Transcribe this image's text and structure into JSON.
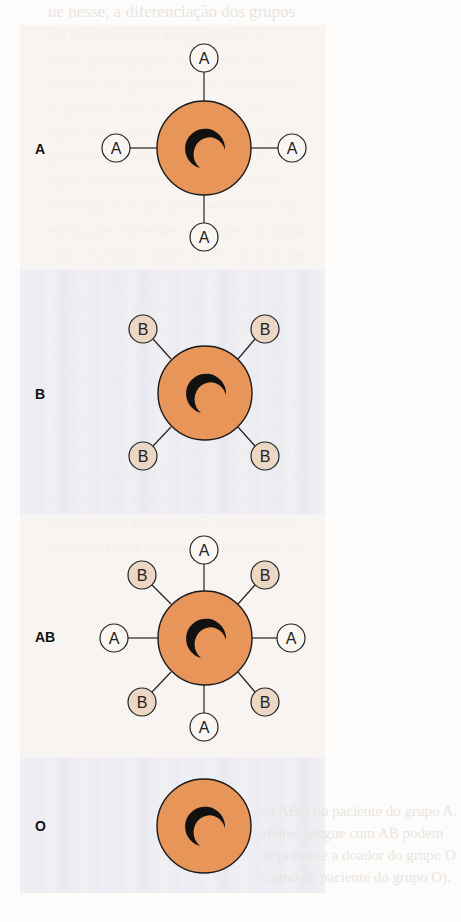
{
  "figure": {
    "colors": {
      "cell_fill": "#e8955a",
      "cell_stroke": "#1a1a1a",
      "antigen_a_fill": "#faf6f1",
      "antigen_b_fill": "#ecd7c4",
      "panel_warm": "#f6f2ee",
      "panel_cool": "#eceef3"
    },
    "panels": [
      {
        "label": "A",
        "antigens": [
          "A",
          "A",
          "A",
          "A"
        ]
      },
      {
        "label": "B",
        "antigens": [
          "B",
          "B",
          "B",
          "B"
        ]
      },
      {
        "label": "AB",
        "antigens": [
          "A",
          "B",
          "A",
          "B",
          "A",
          "B",
          "A",
          "B"
        ]
      },
      {
        "label": "O",
        "antigens": []
      }
    ]
  },
  "background_text": [
    "ue nesse, a diferenciação dos grupos",
    "r à ha diferenças no genótipo, m",
    "dade genotipagem de grupos sa",
    "ficiente em pacientes que receberam",
    "e, quando não se tem doador us",
    "eptor, em pacientes com anticorpo",
    "pessoas que mostram resultados incer",
    "agem eritrocitária por dificuldades",
    "sorológica, o que pode acontecer alg",
    "estigações forenses em testes de aptid",
    ", por exemplo. Entre as técnicas de ge",
    "com maior freqüência estão: a",
    "da polimerase (ou PCR-específica),",
    "(polimorfismo de comprimento de",
    "ição) PCR-RFLP (PCR de restrição",
    "eletroforese) e a técnica de microar",
    "). Por sua precisão relativa facilidade",
    "ilidade de custo, essas técnicas prov",
    "esadas na prática transfusional e corre",
    "ciência do procedimento e segurança",
    "almente transfundidos, com anomali",
    "resentar um grupo ABO atípico sem",
    "dem em larga escala também pode se"
  ],
  "caption_text": [
    "do ABO no paciente do grupo A.",
    "efeitos sangue com AB podem",
    "ue presente a doador do grupo O",
    "(como de paciente do grupo O)."
  ]
}
